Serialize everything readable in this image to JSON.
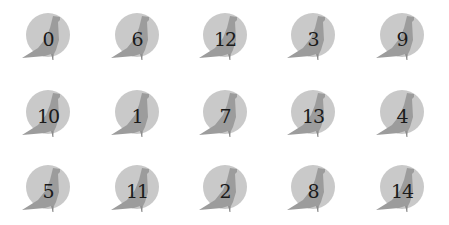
{
  "grid": {
    "rows": 3,
    "columns": 5,
    "icon": "bird-in-circle-icon",
    "colors": {
      "circle": "#c9c9c9",
      "bird": "#9c9c9c",
      "bird_dark": "#8a8a8a",
      "label": "#1a1a1a",
      "background": "#ffffff"
    },
    "items": [
      {
        "label": "0"
      },
      {
        "label": "6"
      },
      {
        "label": "12"
      },
      {
        "label": "3"
      },
      {
        "label": "9"
      },
      {
        "label": "10"
      },
      {
        "label": "1"
      },
      {
        "label": "7"
      },
      {
        "label": "13"
      },
      {
        "label": "4"
      },
      {
        "label": "5"
      },
      {
        "label": "11"
      },
      {
        "label": "2"
      },
      {
        "label": "8"
      },
      {
        "label": "14"
      }
    ]
  }
}
